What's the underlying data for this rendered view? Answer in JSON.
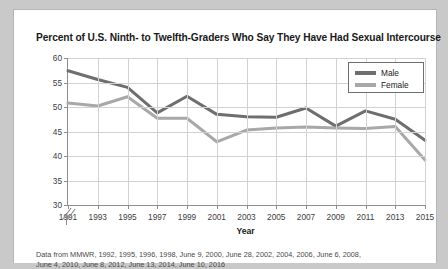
{
  "card": {
    "title": "Percent of U.S. Ninth- to Twelfth-Graders Who Say They Have Had Sexual Intercourse",
    "source_line_1": "Data from MMWR, 1992, 1995, 1996, 1998, June 9, 2000, June 28, 2002, 2004, 2006, June 6, 2008,",
    "source_line_2": "June 4, 2010, June 8, 2012, June 13, 2014, June 10, 2016"
  },
  "colors": {
    "male": "#6e6e6e",
    "female": "#a8a8a8",
    "axis": "#8d8d8d",
    "grid": "#d2d2d2",
    "card_bg": "#ffffff",
    "page_bg": "#c9c9c9",
    "text": "#1a1a1a"
  },
  "chart_data": {
    "type": "line",
    "title": "Percent of U.S. Ninth- to Twelfth-Graders Who Say They Have Had Sexual Intercourse",
    "xlabel": "Year",
    "ylabel": "",
    "x": [
      1991,
      1993,
      1995,
      1997,
      1999,
      2001,
      2003,
      2005,
      2007,
      2009,
      2011,
      2013,
      2015
    ],
    "xticklabels": [
      "1991",
      "1993",
      "1995",
      "1997",
      "1999",
      "2001",
      "2003",
      "2005",
      "2007",
      "2009",
      "2011",
      "2013",
      "2015"
    ],
    "yticklabels": [
      "30",
      "35",
      "40",
      "45",
      "50",
      "55",
      "60"
    ],
    "yticks": [
      30,
      35,
      40,
      45,
      50,
      55,
      60
    ],
    "ylim": [
      30,
      60
    ],
    "xlim": [
      1991,
      2015
    ],
    "grid": true,
    "axis_break": true,
    "legend_position": "top-right",
    "series": [
      {
        "name": "Male",
        "color": "#6e6e6e",
        "values": [
          57.4,
          55.6,
          54.0,
          48.8,
          52.2,
          48.5,
          48.0,
          47.9,
          49.8,
          46.1,
          49.2,
          47.5,
          43.2
        ]
      },
      {
        "name": "Female",
        "color": "#a8a8a8",
        "values": [
          50.8,
          50.2,
          52.1,
          47.7,
          47.7,
          42.9,
          45.3,
          45.7,
          45.9,
          45.7,
          45.6,
          46.0,
          39.2
        ]
      }
    ]
  }
}
